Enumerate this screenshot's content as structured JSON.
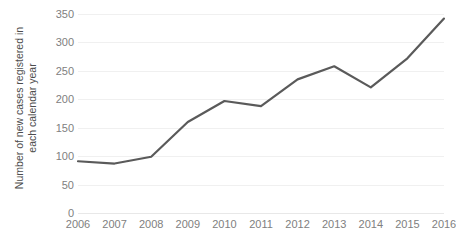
{
  "chart_data": {
    "type": "line",
    "title": "",
    "subtitle": "",
    "xlabel": "",
    "ylabel": "Number of new cases registered in each calendar year",
    "ylabel_line1": "Number of new cases registered in",
    "ylabel_line2": "each calendar year",
    "categories": [
      "2006",
      "2007",
      "2008",
      "2009",
      "2010",
      "2011",
      "2012",
      "2013",
      "2014",
      "2015",
      "2016"
    ],
    "x": [
      2006,
      2007,
      2008,
      2009,
      2010,
      2011,
      2012,
      2013,
      2014,
      2015,
      2016
    ],
    "values": [
      91,
      87,
      99,
      160,
      197,
      188,
      235,
      258,
      221,
      272,
      342
    ],
    "series": [
      {
        "name": "Number of new cases registered in each calendar year",
        "values": [
          91,
          87,
          99,
          160,
          197,
          188,
          235,
          258,
          221,
          272,
          342
        ]
      }
    ],
    "ylim": [
      0,
      350
    ],
    "xlim": [
      2006,
      2016
    ],
    "yticks": [
      0,
      50,
      100,
      150,
      200,
      250,
      300,
      350
    ],
    "ytick_labels": [
      "0",
      "50",
      "100",
      "150",
      "200",
      "250",
      "300",
      "350"
    ],
    "xtick_labels": [
      "2006",
      "2007",
      "2008",
      "2009",
      "2010",
      "2011",
      "2012",
      "2013",
      "2014",
      "2015",
      "2016"
    ],
    "grid": true,
    "grid_axis": "y",
    "legend": false,
    "legend_position": "none",
    "line_color": "#5a5a5a",
    "grid_color": "#f0f0f0",
    "tick_label_color": "#808080",
    "axis_label_color": "#4d4d4d",
    "background_color": "#ffffff",
    "markers": false,
    "line_width": 2.2
  }
}
